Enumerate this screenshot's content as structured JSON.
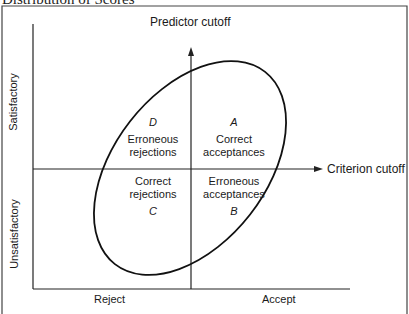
{
  "title": "Distribution of Scores",
  "diagram": {
    "predictor_cutoff_label": "Predictor cutoff",
    "criterion_cutoff_label": "Criterion cutoff",
    "y_axis": {
      "top_label": "Satisfactory",
      "bottom_label": "Unsatisfactory"
    },
    "x_axis": {
      "left_label": "Reject",
      "right_label": "Accept"
    },
    "quadrants": {
      "A": {
        "letter": "A",
        "line1": "Correct",
        "line2": "acceptances"
      },
      "B": {
        "letter": "B",
        "line1": "Erroneous",
        "line2": "acceptances"
      },
      "C": {
        "letter": "C",
        "line1": "Correct",
        "line2": "rejections"
      },
      "D": {
        "letter": "D",
        "line1": "Erroneous",
        "line2": "rejections"
      }
    }
  }
}
